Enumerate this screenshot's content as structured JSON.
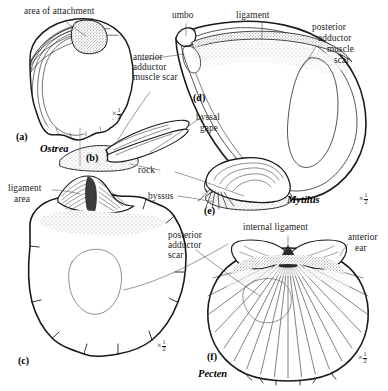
{
  "figure": {
    "background_color": "#ffffff",
    "ink_color": "#1a1a1a",
    "leader_color": "#555555",
    "stipple_color": "#8a8a8a"
  },
  "scale_marks": {
    "times": "×",
    "numerator": "1",
    "denominator": "2"
  },
  "genera": {
    "ostrea": "Ostrea",
    "mytilus": "Mytilus",
    "pecten": "Pecten"
  },
  "panels": {
    "a": "(a)",
    "b": "(b)",
    "c": "(c)",
    "d": "(d)",
    "e": "(e)",
    "f": "(f)"
  },
  "labels": {
    "area_of_attachment": "area of attachment",
    "anterior_adductor_muscle_scar": {
      "line1": "anterior",
      "line2": "adductor",
      "line3": "muscle scar"
    },
    "umbo": "umbo",
    "ligament": "ligament",
    "posterior_adductor_muscle_scar": {
      "line1": "posterior",
      "line2": "adductor",
      "line3": "muscle",
      "line4": "scar"
    },
    "byssal_gape": {
      "line1": "byssal",
      "line2": "gape"
    },
    "rock": "rock",
    "byssus": "byssus",
    "ligament_area": {
      "line1": "ligament",
      "line2": "area"
    },
    "posterior_adductor_scar": {
      "line1": "posterior",
      "line2": "adductor",
      "line3": "scar"
    },
    "internal_ligament": "internal ligament",
    "anterior_ear": {
      "line1": "anterior",
      "line2": "ear"
    }
  }
}
